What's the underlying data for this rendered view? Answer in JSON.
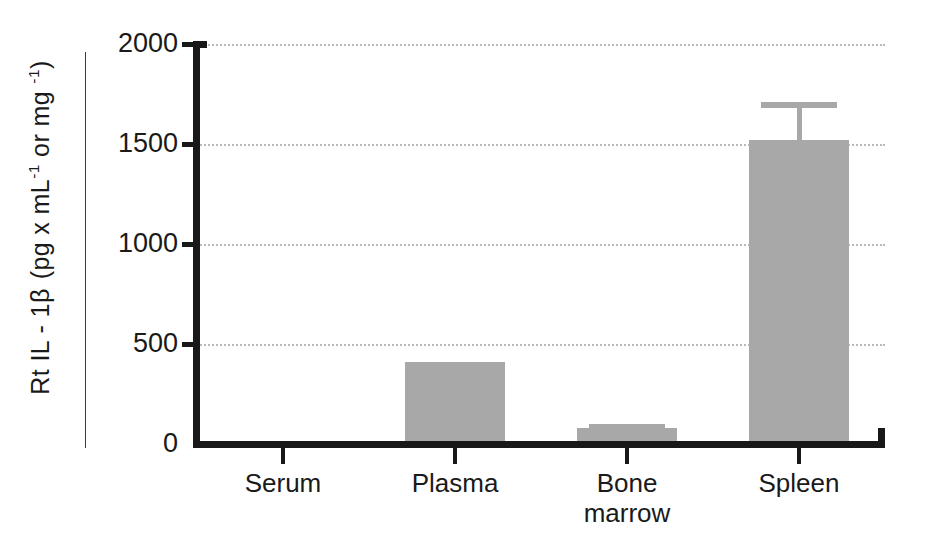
{
  "chart_data": {
    "type": "bar",
    "title": "",
    "xlabel": "",
    "ylabel_parts": {
      "prefix": "Rt IL - 1",
      "beta": "β",
      "unit_open": "(pg x mL",
      "sup1": "-1",
      "unit_mid": " or mg ",
      "sup2": "-1",
      "unit_close": ")"
    },
    "ylabel": "Rt IL - 1β  (pg x mL-1 or mg -1)",
    "categories": [
      "Serum",
      "Plasma",
      "Bone\nmarrow",
      "Spleen"
    ],
    "values": [
      0,
      410,
      80,
      1520
    ],
    "errors": [
      0,
      0,
      20,
      190
    ],
    "ylim": [
      0,
      2000
    ],
    "yticks": [
      0,
      500,
      1000,
      1500,
      2000
    ],
    "ytick_labels": [
      "0",
      "500",
      "1000",
      "1500",
      "2000"
    ],
    "grid": true,
    "grid_axis": "y",
    "grid_style": "dotted",
    "legend": false,
    "legend_position": "none",
    "bar_color": "#a8a8a8",
    "axis_color": "#181818",
    "grid_color": "#b9b9b9",
    "background": "#ffffff"
  }
}
